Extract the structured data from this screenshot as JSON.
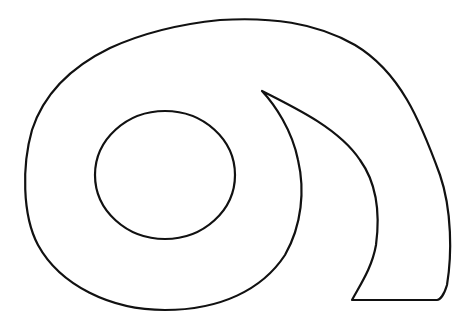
{
  "figure": {
    "background": "#ffffff",
    "stroke_color": "#111111"
  }
}
